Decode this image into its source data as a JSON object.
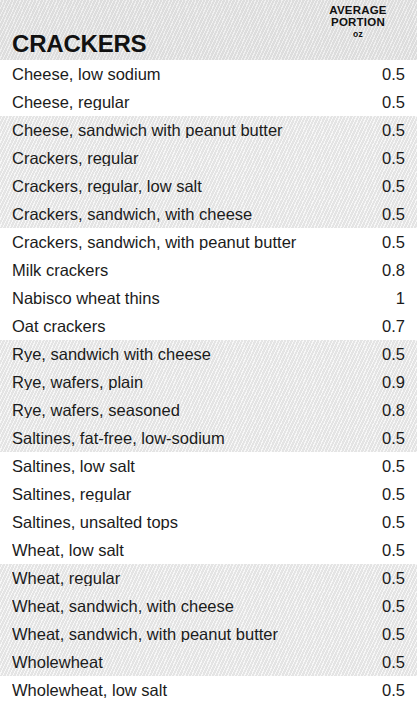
{
  "header": {
    "category_title": "CRACKERS",
    "measure_label_line1": "AVERAGE",
    "measure_label_line2": "PORTION",
    "measure_unit": "oz"
  },
  "columns": {
    "name_header": "CRACKERS",
    "value_header": "AVERAGE PORTION oz"
  },
  "chart_data": {
    "type": "table",
    "title": "CRACKERS",
    "columns": [
      "Food",
      "Average portion (oz)"
    ],
    "unit": "oz",
    "categories": [
      "Cheese, low sodium",
      "Cheese, regular",
      "Cheese, sandwich with peanut butter",
      "Crackers, regular",
      "Crackers, regular, low salt",
      "Crackers, sandwich, with cheese",
      "Crackers, sandwich, with peanut butter",
      "Milk crackers",
      "Nabisco wheat thins",
      "Oat crackers",
      "Rye, sandwich with cheese",
      "Rye, wafers, plain",
      "Rye, wafers, seasoned",
      "Saltines, fat-free, low-sodium",
      "Saltines, low salt",
      "Saltines, regular",
      "Saltines, unsalted tops",
      "Wheat, low salt",
      "Wheat, regular",
      "Wheat, sandwich, with cheese",
      "Wheat, sandwich, with peanut butter",
      "Wholewheat",
      "Wholewheat, low salt"
    ],
    "values": [
      0.5,
      0.5,
      0.5,
      0.5,
      0.5,
      0.5,
      0.5,
      0.8,
      1,
      0.7,
      0.5,
      0.9,
      0.8,
      0.5,
      0.5,
      0.5,
      0.5,
      0.5,
      0.5,
      0.5,
      0.5,
      0.5,
      0.5
    ]
  },
  "rows": [
    {
      "name": "Cheese, low sodium",
      "value": "0.5",
      "shaded": false
    },
    {
      "name": "Cheese, regular",
      "value": "0.5",
      "shaded": false
    },
    {
      "name": "Cheese, sandwich with peanut butter",
      "value": "0.5",
      "shaded": true
    },
    {
      "name": "Crackers, regular",
      "value": "0.5",
      "shaded": true
    },
    {
      "name": "Crackers, regular, low salt",
      "value": "0.5",
      "shaded": true
    },
    {
      "name": "Crackers, sandwich, with cheese",
      "value": "0.5",
      "shaded": true
    },
    {
      "name": "Crackers, sandwich, with peanut butter",
      "value": "0.5",
      "shaded": false
    },
    {
      "name": "Milk crackers",
      "value": "0.8",
      "shaded": false
    },
    {
      "name": "Nabisco wheat thins",
      "value": "1",
      "shaded": false
    },
    {
      "name": "Oat crackers",
      "value": "0.7",
      "shaded": false
    },
    {
      "name": "Rye, sandwich with cheese",
      "value": "0.5",
      "shaded": true
    },
    {
      "name": "Rye, wafers, plain",
      "value": "0.9",
      "shaded": true
    },
    {
      "name": "Rye, wafers, seasoned",
      "value": "0.8",
      "shaded": true
    },
    {
      "name": "Saltines, fat-free, low-sodium",
      "value": "0.5",
      "shaded": true
    },
    {
      "name": "Saltines, low salt",
      "value": "0.5",
      "shaded": false
    },
    {
      "name": "Saltines, regular",
      "value": "0.5",
      "shaded": false
    },
    {
      "name": "Saltines, unsalted tops",
      "value": "0.5",
      "shaded": false
    },
    {
      "name": "Wheat, low salt",
      "value": "0.5",
      "shaded": false
    },
    {
      "name": "Wheat, regular",
      "value": "0.5",
      "shaded": true
    },
    {
      "name": "Wheat, sandwich, with cheese",
      "value": "0.5",
      "shaded": true
    },
    {
      "name": "Wheat, sandwich, with peanut butter",
      "value": "0.5",
      "shaded": true
    },
    {
      "name": "Wholewheat",
      "value": "0.5",
      "shaded": true
    },
    {
      "name": "Wholewheat, low salt",
      "value": "0.5",
      "shaded": false
    }
  ]
}
